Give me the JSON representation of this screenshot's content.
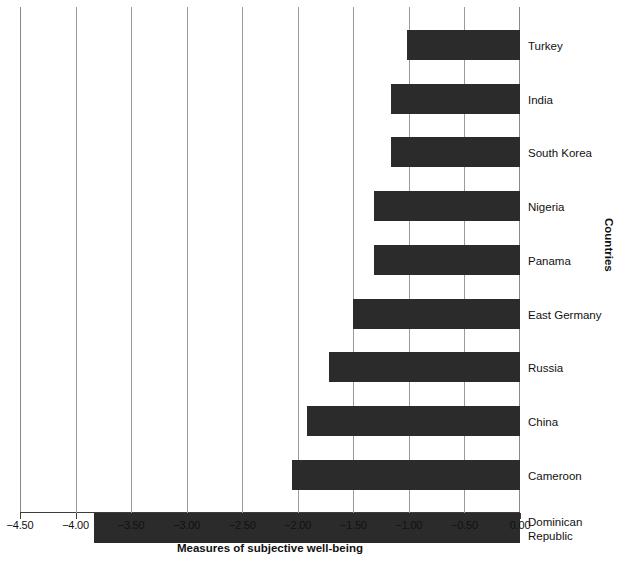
{
  "chart_data": {
    "type": "bar",
    "orientation": "horizontal",
    "title": "",
    "xlabel": "Measures of subjective well-being",
    "ylabel": "Countries",
    "categories": [
      "Turkey",
      "India",
      "South Korea",
      "Nigeria",
      "Panama",
      "East Germany",
      "Russia",
      "China",
      "Cameroon",
      "Dominican\nRepublic"
    ],
    "values": [
      -1.02,
      -1.16,
      -1.16,
      -1.31,
      -1.31,
      -1.5,
      -1.72,
      -1.92,
      -2.05,
      -3.83
    ],
    "xlim": [
      -4.5,
      0.0
    ],
    "xticks": [
      -4.5,
      -4.0,
      -3.5,
      -3.0,
      -2.5,
      -2.0,
      -1.5,
      -1.0,
      -0.5,
      0.0
    ],
    "xticklabels": [
      "−4.50",
      "−4.00",
      "−3.50",
      "−3.00",
      "−2.50",
      "−2.00",
      "−1.50",
      "−1.00",
      "−0.50",
      "0.00"
    ],
    "grid": "vertical",
    "legend": "none",
    "bar_color": "#2b2b2b",
    "grid_color": "#9a9a9a",
    "axis_color": "#3c3c3c",
    "background": "#ffffff"
  },
  "caption": {
    "partial_text": ""
  }
}
